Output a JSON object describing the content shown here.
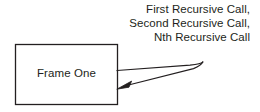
{
  "diagram": {
    "type": "recursion-call-diagram",
    "background_color": "#ffffff",
    "stroke_color": "#231f20",
    "text_color": "#231f20",
    "frame_box": {
      "label": "Frame One",
      "x": 15,
      "y": 44,
      "width": 103,
      "height": 61,
      "fill": "#ffffff",
      "border_color": "#231f20"
    },
    "self_call_arrow": {
      "name": "recursive-call-arrow",
      "start_x": 117,
      "start_y": 70,
      "tip_x": 203,
      "tip_y": 62,
      "end_x": 118,
      "end_y": 88,
      "direction": "loops right and returns into the frame",
      "arrowhead": "filled-triangle-pointing-left-down"
    },
    "annotation": {
      "name": "recursive-call-labels",
      "alignment": "right",
      "lines": [
        "First Recursive Call,",
        "Second Recursive Call,",
        "Nth Recursive Call"
      ],
      "line_1": "First Recursive Call,",
      "line_2": "Second Recursive Call,",
      "line_3": "Nth Recursive Call"
    }
  }
}
